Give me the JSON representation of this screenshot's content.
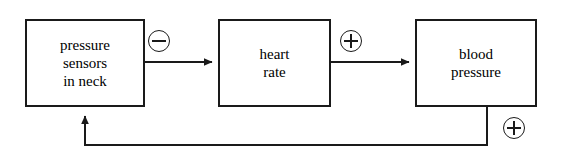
{
  "diagram": {
    "type": "block-diagram",
    "background_color": "#ffffff",
    "line_color": "#1a1a1a",
    "blocks": [
      {
        "id": "pressure-sensors",
        "label": "pressure\nsensors\nin neck",
        "x": 25,
        "y": 19,
        "width": 120,
        "height": 88
      },
      {
        "id": "heart-rate",
        "label": "heart\nrate",
        "x": 218,
        "y": 19,
        "width": 113,
        "height": 88
      },
      {
        "id": "blood-pressure",
        "label": "blood\npressure",
        "x": 415,
        "y": 19,
        "width": 122,
        "height": 88
      }
    ],
    "signs": [
      {
        "id": "inhibit-heart-rate",
        "symbol": "minus",
        "glyph": "⊖",
        "on_edge": "pressure-sensors-to-heart-rate",
        "x": 148,
        "y": 30
      },
      {
        "id": "excite-blood-pressure",
        "symbol": "plus",
        "glyph": "⊕",
        "on_edge": "heart-rate-to-blood-pressure",
        "x": 340,
        "y": 30
      },
      {
        "id": "feedback-positive",
        "symbol": "plus",
        "glyph": "⊕",
        "on_edge": "blood-pressure-to-pressure-sensors",
        "x": 503,
        "y": 117
      }
    ],
    "edges": [
      {
        "id": "pressure-sensors-to-heart-rate",
        "from": "pressure-sensors",
        "to": "heart-rate",
        "sign": "minus",
        "path": "M 145 62 L 216 62",
        "arrow_at": "heart-rate"
      },
      {
        "id": "heart-rate-to-blood-pressure",
        "from": "heart-rate",
        "to": "blood-pressure",
        "sign": "plus",
        "path": "M 331 62 L 413 62",
        "arrow_at": "blood-pressure"
      },
      {
        "id": "blood-pressure-to-pressure-sensors",
        "from": "blood-pressure",
        "to": "pressure-sensors",
        "sign": "plus",
        "path": "M 487 107 L 487 145 L 85 145 L 85 112",
        "arrow_at": "pressure-sensors"
      }
    ]
  }
}
